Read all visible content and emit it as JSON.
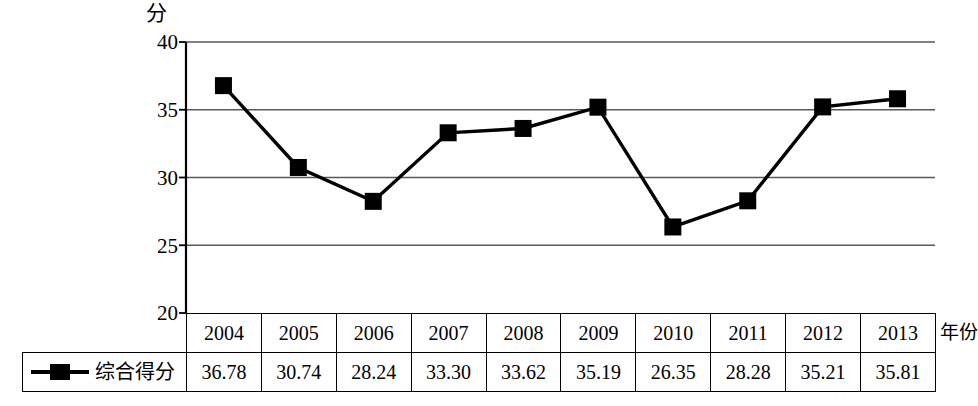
{
  "chart_data": {
    "type": "line",
    "title": "",
    "xlabel": "年份",
    "ylabel": "分",
    "categories": [
      "2004",
      "2005",
      "2006",
      "2007",
      "2008",
      "2009",
      "2010",
      "2011",
      "2012",
      "2013"
    ],
    "series": [
      {
        "name": "综合得分",
        "values": [
          36.78,
          30.74,
          28.24,
          33.3,
          33.62,
          35.19,
          26.35,
          28.28,
          35.21,
          35.81
        ],
        "marker": "square",
        "color": "#000000"
      }
    ],
    "ylim": [
      20,
      40
    ],
    "yticks": [
      20,
      25,
      30,
      35,
      40
    ],
    "ytick_labels": [
      "20",
      "25",
      "30",
      "35",
      "40"
    ],
    "grid": true,
    "grid_axis": "y",
    "legend_position": "bottom-left-table"
  },
  "axis": {
    "y_unit_label": "分",
    "x_name_label": "年份",
    "y_tick_labels": [
      "40",
      "35",
      "30",
      "25",
      "20"
    ]
  },
  "table": {
    "legend_label": "综合得分",
    "year_row": [
      "2004",
      "2005",
      "2006",
      "2007",
      "2008",
      "2009",
      "2010",
      "2011",
      "2012",
      "2013"
    ],
    "value_row": [
      "36.78",
      "30.74",
      "28.24",
      "33.30",
      "33.62",
      "35.19",
      "26.35",
      "28.28",
      "35.21",
      "35.81"
    ]
  },
  "style": {
    "line_color": "#000000",
    "marker_color": "#000000",
    "grid_color": "#595959",
    "axis_color": "#000000",
    "background": "#ffffff"
  }
}
